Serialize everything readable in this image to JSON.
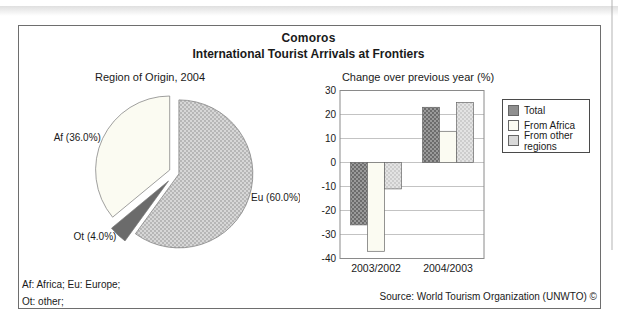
{
  "page": {
    "title": "Comoros",
    "subtitle": "International Tourist Arrivals at Frontiers"
  },
  "footer": {
    "note1": "Af: Africa; Eu: Europe;",
    "note2": "Ot: other;",
    "source": "Source: World Tourism Organization (UNWTO) ©"
  },
  "palette": {
    "text": "#1a1a1a",
    "frame_border": "#6e6e6e",
    "outline": "#777777",
    "grid": "#b4b4b4",
    "plot_frame": "#8a8a8a",
    "eu_base": "#d7d7d7",
    "eu_dot": "#a8a8a8",
    "af_fill": "#fbfbf2",
    "ot_fill": "#6b6b6b",
    "total_base": "#9a9a9a",
    "total_dot": "#565656",
    "africa_fill": "#fbfbf2",
    "other_base": "#e3e3e3",
    "other_dot": "#c2c2c2",
    "legend_swatch_total": "#8f8f8f",
    "legend_swatch_africa": "#fbfbf2",
    "legend_swatch_other": "#d9d9d9"
  },
  "chart_data": [
    {
      "type": "pie",
      "title": "Region of Origin, 2004",
      "unit": "%",
      "start_angle_deg": 0,
      "direction": "clockwise",
      "slices": [
        {
          "label": "Eu",
          "name": "Europe",
          "pct": 60.0,
          "display": "Eu (60.0%)",
          "color_key": "eu",
          "explode_px": 3
        },
        {
          "label": "Ot",
          "name": "other",
          "pct": 4.0,
          "display": "Ot (4.0%)",
          "color_key": "ot",
          "explode_px": 11
        },
        {
          "label": "Af",
          "name": "Africa",
          "pct": 36.0,
          "display": "Af (36.0%)",
          "color_key": "af",
          "explode_px": 7
        }
      ]
    },
    {
      "type": "bar",
      "title": "Change over previous year (%)",
      "categories": [
        "2003/2002",
        "2004/2003"
      ],
      "series": [
        {
          "name": "Total",
          "values": [
            -26,
            23
          ],
          "color_key": "total"
        },
        {
          "name": "From Africa",
          "values": [
            -37,
            13
          ],
          "color_key": "africa"
        },
        {
          "name": "From other regions",
          "values": [
            -11,
            25
          ],
          "color_key": "other"
        }
      ],
      "ylim": [
        -40,
        30
      ],
      "ytick_step": 10,
      "grid": true,
      "legend_position": "right"
    }
  ]
}
